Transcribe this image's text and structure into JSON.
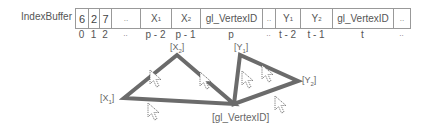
{
  "title": "IndexBuffer",
  "buffer": {
    "cells": [
      {
        "value": "6",
        "index": "0",
        "width": 13
      },
      {
        "value": "2",
        "index": "1",
        "width": 11
      },
      {
        "value": "7",
        "index": "2",
        "width": 12
      },
      {
        "value": "..",
        "index": "..",
        "width": 29
      },
      {
        "value": "X1",
        "index": "p - 2",
        "width": 31
      },
      {
        "value": "X2",
        "index": "p - 1",
        "width": 29
      },
      {
        "value": "gl_VertexID",
        "index": "p",
        "width": 62
      },
      {
        "value": "..",
        "index": "..",
        "width": 13
      },
      {
        "value": "Y1",
        "index": "t - 2",
        "width": 25
      },
      {
        "value": "Y2",
        "index": "t - 1",
        "width": 32
      },
      {
        "value": "gl_VertexID",
        "index": "t",
        "width": 61
      },
      {
        "value": "..",
        "index": "..",
        "width": 17
      }
    ]
  },
  "vertices": {
    "x1": {
      "label": "[X1]",
      "x": 124,
      "y": 98
    },
    "x2": {
      "label": "[X2]",
      "x": 177,
      "y": 55
    },
    "apex": {
      "label": "[gl_VertexID]",
      "x": 234,
      "y": 104
    },
    "y1": {
      "label": "[Y1]",
      "x": 240,
      "y": 55
    },
    "y2": {
      "label": "[Y2]",
      "x": 298,
      "y": 81
    }
  },
  "colors": {
    "edge": "#6b6b6b",
    "grid": "#999999",
    "text": "#555555"
  }
}
